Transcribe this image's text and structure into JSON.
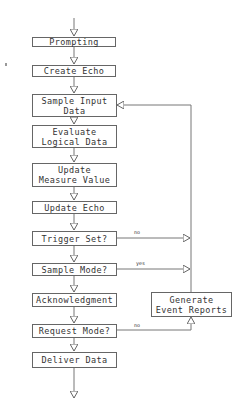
{
  "diagram": {
    "type": "flowchart",
    "nodes": [
      {
        "id": "prompting",
        "label": "Prompting"
      },
      {
        "id": "create_echo",
        "label": "Create Echo"
      },
      {
        "id": "sample_input",
        "label": "Sample Input\nData"
      },
      {
        "id": "evaluate",
        "label": "Evaluate\nLogical Data"
      },
      {
        "id": "update_measure",
        "label": "Update\nMeasure Value"
      },
      {
        "id": "update_echo",
        "label": "Update Echo"
      },
      {
        "id": "trigger_set",
        "label": "Trigger Set?"
      },
      {
        "id": "sample_mode",
        "label": "Sample Mode?"
      },
      {
        "id": "acknowledgment",
        "label": "Acknowledgment"
      },
      {
        "id": "request_mode",
        "label": "Request Mode?"
      },
      {
        "id": "deliver_data",
        "label": "Deliver Data"
      },
      {
        "id": "generate_reports",
        "label": "Generate\nEvent Reports"
      }
    ],
    "edge_labels": {
      "trigger_no": "no",
      "sample_yes": "yes",
      "request_no": "no"
    }
  }
}
